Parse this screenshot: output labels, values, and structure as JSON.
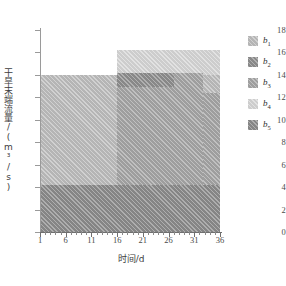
{
  "chart_data": {
    "type": "area",
    "title": "",
    "xlabel": "时间/d",
    "ylabel": "干旱末端流量/(m³/s)",
    "xlim": [
      1,
      36
    ],
    "ylim": [
      0,
      18
    ],
    "xticks": [
      1,
      6,
      11,
      16,
      21,
      26,
      31,
      36
    ],
    "yticks": [
      0,
      2,
      4,
      6,
      8,
      10,
      12,
      14,
      16,
      18
    ],
    "grid": false,
    "legend_position": "right",
    "series": [
      {
        "name": "b1",
        "label": "b",
        "sub": "1",
        "color": "#bdbdbd",
        "segments": [
          {
            "x_start": 1,
            "x_end": 36,
            "y_start": 0,
            "y_end": 14.0
          }
        ]
      },
      {
        "name": "b2",
        "label": "b",
        "sub": "2",
        "color": "#8e8e8e",
        "segments": [
          {
            "x_start": 16,
            "x_end": 26,
            "y_start": 12.9,
            "y_end": 14.2
          }
        ]
      },
      {
        "name": "b3",
        "label": "b",
        "sub": "3",
        "color": "#a5a5a5",
        "segments": [
          {
            "x_start": 16,
            "x_end": 31,
            "y_start": 0,
            "y_end": 14.2
          },
          {
            "x_start": 31,
            "x_end": 36,
            "y_start": 0,
            "y_end": 12.4
          }
        ]
      },
      {
        "name": "b4",
        "label": "b",
        "sub": "4",
        "color": "#d6d6d6",
        "segments": [
          {
            "x_start": 16,
            "x_end": 36,
            "y_start": 0,
            "y_end": 16.2
          }
        ]
      },
      {
        "name": "b5",
        "label": "b",
        "sub": "5",
        "color": "#8b8b8b",
        "segments": [
          {
            "x_start": 1,
            "x_end": 36,
            "y_start": 0,
            "y_end": 4.2
          }
        ]
      }
    ]
  },
  "axes": {
    "x_title": "时间/d",
    "y_title": "干旱末端流量/(m³/s)",
    "x_tick_labels": [
      "1",
      "6",
      "11",
      "16",
      "21",
      "26",
      "31",
      "36"
    ],
    "y_tick_labels": [
      "0",
      "2",
      "4",
      "6",
      "8",
      "10",
      "12",
      "14",
      "16",
      "18"
    ]
  },
  "legend": {
    "items": [
      {
        "label": "b",
        "sub": "1",
        "color": "#bdbdbd"
      },
      {
        "label": "b",
        "sub": "2",
        "color": "#8e8e8e"
      },
      {
        "label": "b",
        "sub": "3",
        "color": "#a5a5a5"
      },
      {
        "label": "b",
        "sub": "4",
        "color": "#d6d6d6"
      },
      {
        "label": "b",
        "sub": "5",
        "color": "#8b8b8b"
      }
    ]
  }
}
